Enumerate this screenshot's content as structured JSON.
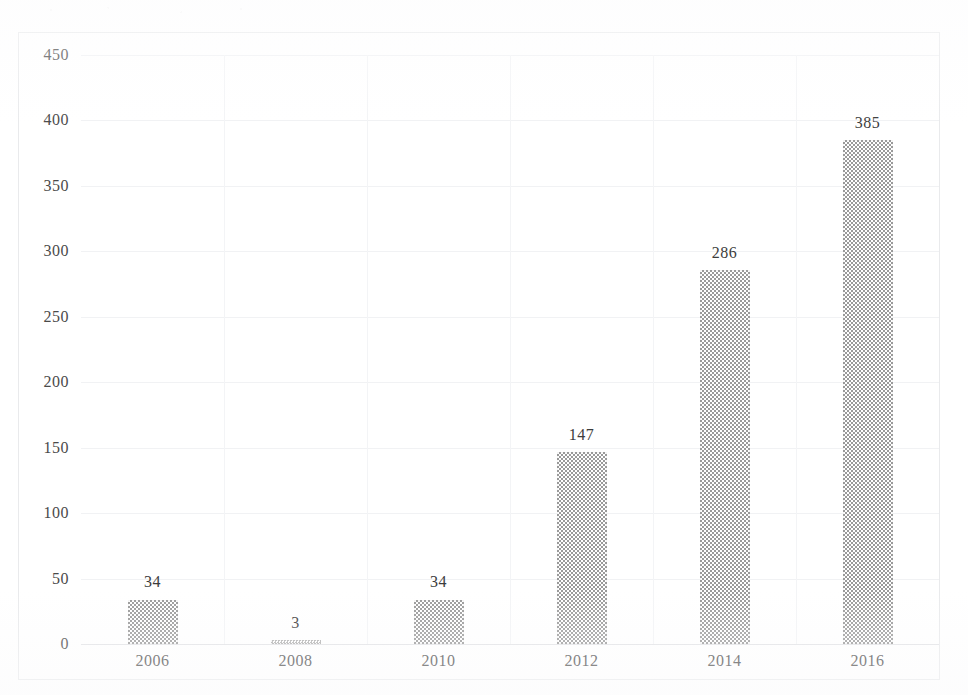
{
  "chart_data": {
    "type": "bar",
    "title": "",
    "subtitle": "",
    "xlabel": "",
    "ylabel": "",
    "categories": [
      "2006",
      "2008",
      "2010",
      "2012",
      "2014",
      "2016"
    ],
    "values": [
      34,
      3,
      34,
      147,
      286,
      385
    ],
    "data_labels": [
      "34",
      "3",
      "34",
      "147",
      "286",
      "385"
    ],
    "ylim": [
      0,
      450
    ],
    "ytick_step": 50,
    "ytick_labels": [
      "0",
      "50",
      "100",
      "150",
      "200",
      "250",
      "300",
      "350",
      "400",
      "450"
    ],
    "ytick_values": [
      0,
      50,
      100,
      150,
      200,
      250,
      300,
      350,
      400,
      450
    ],
    "xtick_labels": [
      "2006",
      "2008",
      "2010",
      "2012",
      "2014",
      "2016"
    ],
    "grid": {
      "horizontal": true,
      "vertical": true
    },
    "legend": {
      "visible": false,
      "position": "none",
      "entries": []
    },
    "series": [
      {
        "name": "",
        "values": [
          34,
          3,
          34,
          147,
          286,
          385
        ]
      }
    ],
    "annotations": []
  },
  "style": {
    "bar_fill": "#9a9a9a",
    "bar_pattern": "checker-dither",
    "gridline_color": "#f1f2f4",
    "axis_color": "#e2e3e6",
    "text_color": "#4a4a4a",
    "background": "#ffffff",
    "frame_color": "#e9eaec"
  }
}
